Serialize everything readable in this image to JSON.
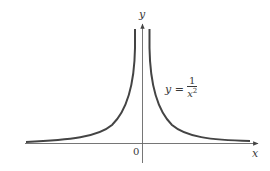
{
  "figure": {
    "function": "y = 1/x^2",
    "axis_labels": {
      "x": "x",
      "y": "y"
    },
    "origin_label": "0",
    "equation": {
      "lhs": "y =",
      "numerator": "1",
      "denominator_base": "x",
      "denominator_exp": "2"
    },
    "colors": {
      "curve": "#444444",
      "axis": "#555555",
      "text": "#3a3a3a",
      "background": "#ffffff"
    }
  }
}
